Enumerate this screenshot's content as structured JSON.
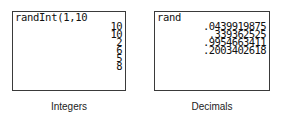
{
  "panels": [
    {
      "command": "randInt(1,10",
      "results": [
        "10",
        "10",
        "2",
        "6",
        "5",
        "8"
      ],
      "caption": "Integers"
    },
    {
      "command": "rand",
      "results": [
        ".0439919875",
        ".339362525",
        ".9954663411",
        ".2003402618"
      ],
      "caption": "Decimals"
    }
  ]
}
